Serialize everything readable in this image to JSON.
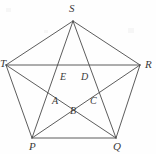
{
  "figure": {
    "type": "geometry-diagram",
    "background_color": "#fefefe",
    "line_color": "#4a4a4a",
    "label_color": "#3a3a3a",
    "outer_vertices": [
      {
        "id": "S",
        "label": "S",
        "x": 73,
        "y": 21,
        "label_x": 69,
        "label_y": 3
      },
      {
        "id": "T",
        "label": "T",
        "x": 6,
        "y": 65,
        "label_x": 0,
        "label_y": 58
      },
      {
        "id": "R",
        "label": "R",
        "x": 140,
        "y": 65,
        "label_x": 145,
        "label_y": 59
      },
      {
        "id": "P",
        "label": "P",
        "x": 32,
        "y": 138,
        "label_x": 29,
        "label_y": 141
      },
      {
        "id": "Q",
        "label": "Q",
        "x": 116,
        "y": 138,
        "label_x": 113,
        "label_y": 141
      }
    ],
    "inner_vertices": [
      {
        "id": "E",
        "label": "E",
        "x": 64,
        "y": 72,
        "label_x": 60,
        "label_y": 72
      },
      {
        "id": "D",
        "label": "D",
        "x": 85,
        "y": 72,
        "label_x": 81,
        "label_y": 72
      },
      {
        "id": "C",
        "label": "C",
        "x": 93,
        "y": 98,
        "label_x": 90,
        "label_y": 96
      },
      {
        "id": "B",
        "label": "B",
        "x": 74,
        "y": 110,
        "label_x": 70,
        "label_y": 106
      },
      {
        "id": "A",
        "label": "A",
        "x": 57,
        "y": 98,
        "label_x": 52,
        "label_y": 96
      }
    ],
    "edges": [
      {
        "name": "edge-S-T",
        "from": "S",
        "to": "T"
      },
      {
        "name": "edge-T-P",
        "from": "T",
        "to": "P"
      },
      {
        "name": "edge-P-Q",
        "from": "P",
        "to": "Q"
      },
      {
        "name": "edge-Q-R",
        "from": "Q",
        "to": "R"
      },
      {
        "name": "edge-R-S",
        "from": "R",
        "to": "S"
      }
    ],
    "diagonals": [
      {
        "name": "diagonal-T-R",
        "from": "T",
        "to": "R"
      },
      {
        "name": "diagonal-S-P",
        "from": "S",
        "to": "P"
      },
      {
        "name": "diagonal-S-Q",
        "from": "S",
        "to": "Q"
      },
      {
        "name": "diagonal-T-Q",
        "from": "T",
        "to": "Q"
      },
      {
        "name": "diagonal-R-P",
        "from": "R",
        "to": "P"
      }
    ]
  }
}
